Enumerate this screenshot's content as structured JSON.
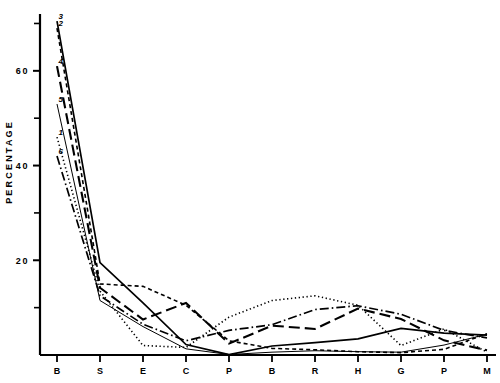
{
  "chart_data": {
    "type": "line",
    "title": "",
    "xlabel": "",
    "ylabel": "PERCENTAGE",
    "x_categories": [
      "B",
      "S",
      "E",
      "C",
      "P",
      "B",
      "R",
      "H",
      "G",
      "P",
      "M"
    ],
    "x_tick_labels": [
      "B",
      "S",
      "E",
      "C",
      "PB",
      "R",
      "H",
      "G",
      "PM"
    ],
    "y_tick_labels": [
      "60",
      "40",
      "20"
    ],
    "y_tick_values": [
      60,
      40,
      20
    ],
    "y_minor_tick_values": [
      70,
      50,
      30,
      10
    ],
    "ylim": [
      0,
      72
    ],
    "grid": false,
    "legend_position": "inline-left",
    "series": [
      {
        "name": "1",
        "label": "1",
        "style": "dotted",
        "label_value": 46,
        "values": [
          46.0,
          13.5,
          2.0,
          1.6,
          8.0,
          11.5,
          12.5,
          10.5,
          2.0,
          5.5,
          0.6
        ]
      },
      {
        "name": "2",
        "label": "2",
        "style": "dashed-fine",
        "label_value": 69,
        "values": [
          69.0,
          15.0,
          14.5,
          10.5,
          3.0,
          1.4,
          1.1,
          0.7,
          0.5,
          1.2,
          4.5
        ]
      },
      {
        "name": "3",
        "label": "3",
        "style": "solid",
        "label_value": 70.5,
        "values": [
          70.5,
          19.5,
          11.0,
          2.2,
          0.1,
          1.9,
          2.6,
          3.4,
          5.6,
          4.6,
          4.2
        ]
      },
      {
        "name": "4",
        "label": "4",
        "style": "dashed-long",
        "label_value": 61,
        "values": [
          61.0,
          14.2,
          7.5,
          11.0,
          2.4,
          6.2,
          5.5,
          9.8,
          7.6,
          3.1,
          1.0
        ]
      },
      {
        "name": "5",
        "label": "5",
        "style": "solid-thin",
        "label_value": 53,
        "values": [
          53.0,
          11.5,
          6.0,
          1.3,
          0.1,
          0.6,
          0.9,
          0.7,
          0.6,
          2.1,
          4.4
        ]
      },
      {
        "name": "6",
        "label": "6",
        "style": "dash-dot",
        "label_value": 42,
        "values": [
          42.0,
          12.5,
          6.5,
          3.0,
          5.2,
          6.4,
          9.6,
          10.4,
          8.6,
          5.2,
          3.6
        ]
      }
    ]
  },
  "axis": {
    "line_color": "#000000",
    "percentage_label": "PERCENTAGE"
  }
}
